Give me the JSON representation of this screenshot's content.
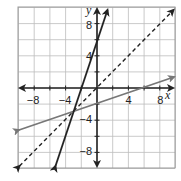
{
  "chart_data": {
    "type": "line",
    "title": "",
    "xlabel": "x",
    "ylabel": "y",
    "xlim": [
      -10,
      10
    ],
    "ylim": [
      -10,
      10
    ],
    "grid": true,
    "grid_step": 2,
    "x_ticks": [
      -8,
      -4,
      4,
      8
    ],
    "y_ticks": [
      8,
      4,
      -4,
      -8
    ],
    "x_tick_labels": [
      "−8",
      "−4",
      "4",
      "8"
    ],
    "y_tick_labels": [
      "8",
      "4",
      "−4",
      "−8"
    ],
    "series": [
      {
        "name": "steep line",
        "equation": "y = 3x + 6",
        "slope": 3,
        "intercept": 6,
        "style": "solid",
        "color": "#222222",
        "x": [
          -5.3,
          1.3
        ],
        "y": [
          -9.9,
          9.9
        ]
      },
      {
        "name": "dashed line",
        "equation": "y = x",
        "slope": 1,
        "intercept": 0,
        "style": "dashed",
        "color": "#222222",
        "x": [
          -9.9,
          9.9
        ],
        "y": [
          -9.9,
          9.9
        ]
      },
      {
        "name": "gray line",
        "equation": "y = x/3 - 2",
        "slope": 0.3333,
        "intercept": -2,
        "style": "solid",
        "color": "#777777",
        "x": [
          -9.9,
          9.9
        ],
        "y": [
          -5.3,
          1.3
        ]
      }
    ],
    "intersection": {
      "x": -3,
      "y": -3
    },
    "legend": []
  },
  "labels": {
    "x_axis": "x",
    "y_axis": "y",
    "ticks": {
      "xn8": "−8",
      "xn4": "−4",
      "x4": "4",
      "x8": "8",
      "y8": "8",
      "y4": "4",
      "yn4": "−4",
      "yn8": "−8"
    }
  }
}
